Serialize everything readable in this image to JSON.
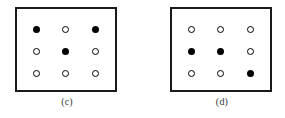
{
  "figure": {
    "background_color": "#ffffff",
    "stroke_color": "#1a1a1a",
    "filled_dot_color": "#000000",
    "open_dot_color": "#ffffff",
    "caption_color": "#3a3a3a"
  },
  "panels": [
    {
      "id": "c",
      "caption": "(c)",
      "rows": [
        [
          {
            "state": "filled",
            "symbol": "filled-circle"
          },
          {
            "state": "open",
            "symbol": "open-circle"
          },
          {
            "state": "filled",
            "symbol": "filled-circle"
          }
        ],
        [
          {
            "state": "open",
            "symbol": "open-circle"
          },
          {
            "state": "filled",
            "symbol": "filled-circle"
          },
          {
            "state": "open",
            "symbol": "open-circle"
          }
        ],
        [
          {
            "state": "open",
            "symbol": "open-circle"
          },
          {
            "state": "open",
            "symbol": "open-circle"
          },
          {
            "state": "open",
            "symbol": "open-circle"
          }
        ]
      ]
    },
    {
      "id": "d",
      "caption": "(d)",
      "rows": [
        [
          {
            "state": "open",
            "symbol": "open-circle"
          },
          {
            "state": "open",
            "symbol": "open-circle"
          },
          {
            "state": "open",
            "symbol": "open-circle"
          }
        ],
        [
          {
            "state": "filled",
            "symbol": "filled-circle"
          },
          {
            "state": "filled",
            "symbol": "filled-circle"
          },
          {
            "state": "open",
            "symbol": "open-circle"
          }
        ],
        [
          {
            "state": "open",
            "symbol": "open-circle"
          },
          {
            "state": "open",
            "symbol": "open-circle"
          },
          {
            "state": "filled",
            "symbol": "filled-circle"
          }
        ]
      ]
    }
  ]
}
